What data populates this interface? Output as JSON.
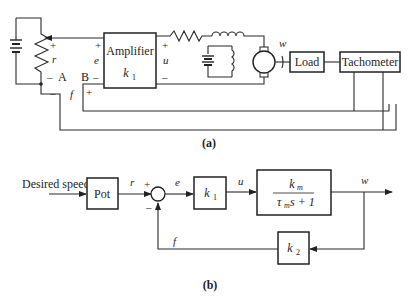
{
  "figure_a": {
    "caption": "(a)",
    "amplifier": {
      "label": "Amplifier",
      "gain": "k",
      "gain_sub": "1"
    },
    "load_label": "Load",
    "tachometer_label": "Tachometer",
    "labels": {
      "r": "r",
      "e": "e",
      "u": "u",
      "f": "f",
      "w": "w",
      "A": "A",
      "B": "B",
      "plus": "+",
      "minus": "–"
    }
  },
  "figure_b": {
    "caption": "(b)",
    "input_label": "Desired speed",
    "pot_label": "Pot",
    "k1": {
      "k": "k",
      "sub": "1"
    },
    "k2": {
      "k": "k",
      "sub": "2"
    },
    "plant": {
      "num_k": "k",
      "num_sub": "m",
      "den_tau": "τ",
      "den_sub": "m",
      "den_rest": " s + 1"
    },
    "signals": {
      "r": "r",
      "e": "e",
      "u": "u",
      "w": "w",
      "f": "f"
    },
    "summer_signs": {
      "plus": "+",
      "minus": "–"
    }
  }
}
